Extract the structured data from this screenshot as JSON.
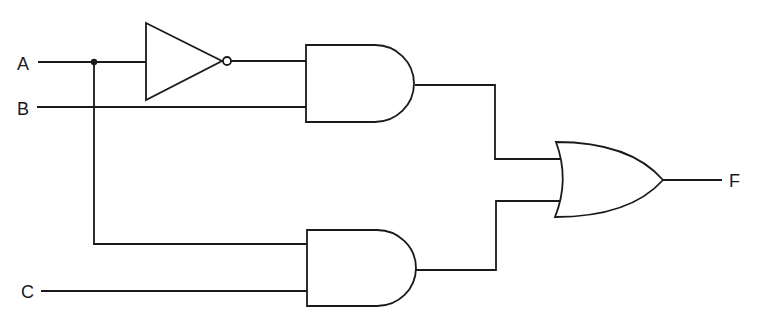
{
  "diagram": {
    "type": "logic-circuit",
    "inputs": [
      {
        "id": "A",
        "label": "A"
      },
      {
        "id": "B",
        "label": "B"
      },
      {
        "id": "C",
        "label": "C"
      }
    ],
    "output": {
      "id": "F",
      "label": "F"
    },
    "gates": [
      {
        "id": "not1",
        "type": "NOT",
        "inputs": [
          "A"
        ]
      },
      {
        "id": "and1",
        "type": "AND",
        "inputs": [
          "not1",
          "B"
        ]
      },
      {
        "id": "and2",
        "type": "AND",
        "inputs": [
          "A",
          "C"
        ]
      },
      {
        "id": "or1",
        "type": "OR",
        "inputs": [
          "and1",
          "and2"
        ],
        "output": "F"
      }
    ],
    "colors": {
      "stroke": "#1a1a1a",
      "background": "#ffffff"
    }
  }
}
